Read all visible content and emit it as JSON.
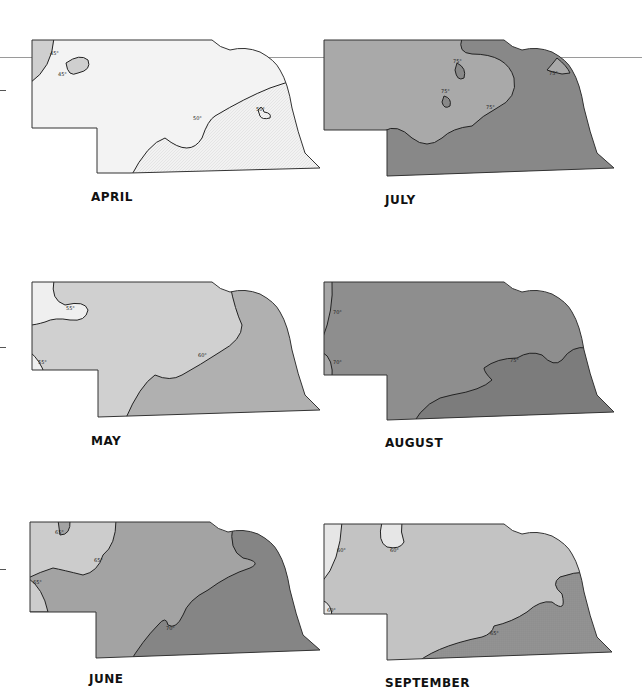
{
  "figure": {
    "colors": {
      "very_light": "#eeeeee",
      "light": "#cfcfcf",
      "medium": "#ababab",
      "dark": "#8a8a8a",
      "darker": "#7a7a7a",
      "outline": "#222222"
    }
  },
  "maps": [
    {
      "month": "APRIL",
      "isotherms": [
        {
          "label": "45°"
        },
        {
          "label": "45°"
        },
        {
          "label": "50°"
        },
        {
          "label": "50°"
        }
      ]
    },
    {
      "month": "JULY",
      "isotherms": [
        {
          "label": "75°"
        },
        {
          "label": "75°"
        },
        {
          "label": "75°"
        },
        {
          "label": "75°"
        }
      ]
    },
    {
      "month": "MAY",
      "isotherms": [
        {
          "label": "55°"
        },
        {
          "label": "55°"
        },
        {
          "label": "60°"
        }
      ]
    },
    {
      "month": "AUGUST",
      "isotherms": [
        {
          "label": "70°"
        },
        {
          "label": "70°"
        },
        {
          "label": "75°"
        }
      ]
    },
    {
      "month": "JUNE",
      "isotherms": [
        {
          "label": "65°"
        },
        {
          "label": "65°"
        },
        {
          "label": "65°"
        },
        {
          "label": "70°"
        }
      ]
    },
    {
      "month": "SEPTEMBER",
      "isotherms": [
        {
          "label": "60°"
        },
        {
          "label": "60°"
        },
        {
          "label": "60°"
        },
        {
          "label": "65°"
        }
      ]
    }
  ]
}
